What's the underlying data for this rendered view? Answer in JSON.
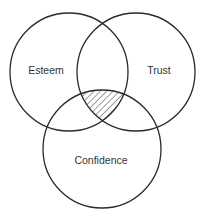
{
  "diagram": {
    "type": "venn",
    "sets": [
      {
        "id": "esteem",
        "label": "Esteem",
        "cx": 69,
        "cy": 72,
        "r": 59,
        "label_x": 46,
        "label_y": 74
      },
      {
        "id": "trust",
        "label": "Trust",
        "cx": 136,
        "cy": 72,
        "r": 59,
        "label_x": 159,
        "label_y": 74
      },
      {
        "id": "confidence",
        "label": "Confidence",
        "cx": 102,
        "cy": 149,
        "r": 59,
        "label_x": 101,
        "label_y": 164
      }
    ],
    "highlighted_region": {
      "description": "intersection of Esteem, Trust and Confidence",
      "fill": "hatched"
    },
    "colors": {
      "stroke": "#2a2a2a",
      "text": "#333333",
      "background": "#ffffff"
    }
  }
}
